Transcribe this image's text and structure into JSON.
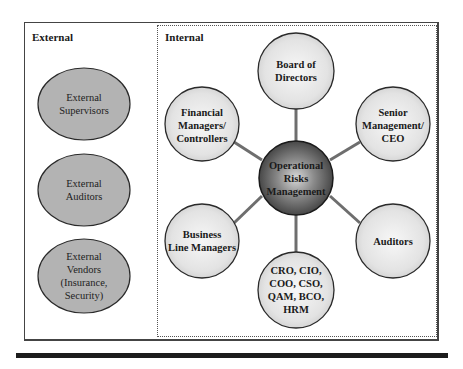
{
  "diagram": {
    "sections": {
      "external": {
        "label": "External"
      },
      "internal": {
        "label": "Internal"
      }
    },
    "center_node": {
      "label_lines": [
        "Operational",
        "Risks",
        "Management"
      ]
    },
    "internal_nodes": [
      {
        "id": "board",
        "label_lines": [
          "Board of",
          "Directors"
        ]
      },
      {
        "id": "senior",
        "label_lines": [
          "Senior",
          "Management/",
          "CEO"
        ]
      },
      {
        "id": "auditors",
        "label_lines": [
          "Auditors"
        ]
      },
      {
        "id": "cxo",
        "label_lines": [
          "CRO, CIO,",
          "COO, CSO,",
          "QAM, BCO,",
          "HRM"
        ]
      },
      {
        "id": "business",
        "label_lines": [
          "Business",
          "Line Managers"
        ]
      },
      {
        "id": "financial",
        "label_lines": [
          "Financial",
          "Managers/",
          "Controllers"
        ]
      }
    ],
    "external_nodes": [
      {
        "id": "supervisors",
        "label_lines": [
          "External",
          "Supervisors"
        ]
      },
      {
        "id": "ext-auditors",
        "label_lines": [
          "External",
          "Auditors"
        ]
      },
      {
        "id": "vendors",
        "label_lines": [
          "External",
          "Vendors",
          "(Insurance,",
          "Security)"
        ]
      }
    ],
    "colors": {
      "external_fill": "#b3b3b3",
      "internal_fill": "#e6e6e6",
      "center_fill": "#5a5a5a",
      "connector": "#6e6e6e",
      "outline": "#2a2a2a"
    }
  }
}
